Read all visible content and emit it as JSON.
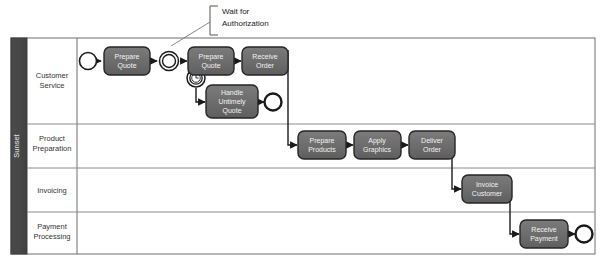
{
  "diagram": {
    "type": "bpmn-process-diagram",
    "pool": {
      "name": "Sunset",
      "header_color": "#4d4d4d",
      "lane_label_bg": "#ffffff",
      "border_color": "#6e6e6e"
    },
    "lanes": [
      {
        "id": "lane-customer-service",
        "label_line1": "Customer",
        "label_line2": "Service"
      },
      {
        "id": "lane-product-preparation",
        "label_line1": "Product",
        "label_line2": "Preparation"
      },
      {
        "id": "lane-invoicing",
        "label_line1": "Invoicing",
        "label_line2": ""
      },
      {
        "id": "lane-payment-processing",
        "label_line1": "Payment",
        "label_line2": "Processing"
      }
    ],
    "tasks": [
      {
        "id": "task-prepare-quote-1",
        "lines": [
          "Prepare",
          "Quote"
        ],
        "lane": "lane-customer-service"
      },
      {
        "id": "task-prepare-quote-2",
        "lines": [
          "Prepare",
          "Quote"
        ],
        "lane": "lane-customer-service"
      },
      {
        "id": "task-receive-order",
        "lines": [
          "Receive",
          "Order"
        ],
        "lane": "lane-customer-service"
      },
      {
        "id": "task-handle-untimely-quote",
        "lines": [
          "Handle",
          "Untimely",
          "Quote"
        ],
        "lane": "lane-customer-service"
      },
      {
        "id": "task-prepare-products",
        "lines": [
          "Prepare",
          "Products"
        ],
        "lane": "lane-product-preparation"
      },
      {
        "id": "task-apply-graphics",
        "lines": [
          "Apply",
          "Graphics"
        ],
        "lane": "lane-product-preparation"
      },
      {
        "id": "task-deliver-order",
        "lines": [
          "Deliver",
          "Order"
        ],
        "lane": "lane-product-preparation"
      },
      {
        "id": "task-invoice-customer",
        "lines": [
          "Invoice",
          "Customer"
        ],
        "lane": "lane-invoicing"
      },
      {
        "id": "task-receive-payment",
        "lines": [
          "Receive",
          "Payment"
        ],
        "lane": "lane-payment-processing"
      }
    ],
    "events": [
      {
        "id": "start-event",
        "kind": "start",
        "lane": "lane-customer-service"
      },
      {
        "id": "intermediate-event-wait",
        "kind": "intermediate",
        "lane": "lane-customer-service"
      },
      {
        "id": "boundary-timer-event",
        "kind": "boundary-timer",
        "lane": "lane-customer-service"
      },
      {
        "id": "end-event-untimely",
        "kind": "end",
        "lane": "lane-customer-service"
      },
      {
        "id": "end-event-payment",
        "kind": "end",
        "lane": "lane-payment-processing"
      }
    ],
    "annotation": {
      "id": "annotation-wait-for-authorization",
      "line1": "Wait for",
      "line2": "Authorization"
    },
    "colors": {
      "task_fill": "#6e6e6e",
      "task_stroke": "#262626",
      "task_text": "#f2f2f2",
      "event_stroke": "#1a1a1a",
      "event_fill": "#ffffff",
      "flow_stroke": "#1a1a1a",
      "lane_text": "#333333",
      "annotation_text": "#1a1a1a",
      "background": "#ffffff"
    }
  }
}
